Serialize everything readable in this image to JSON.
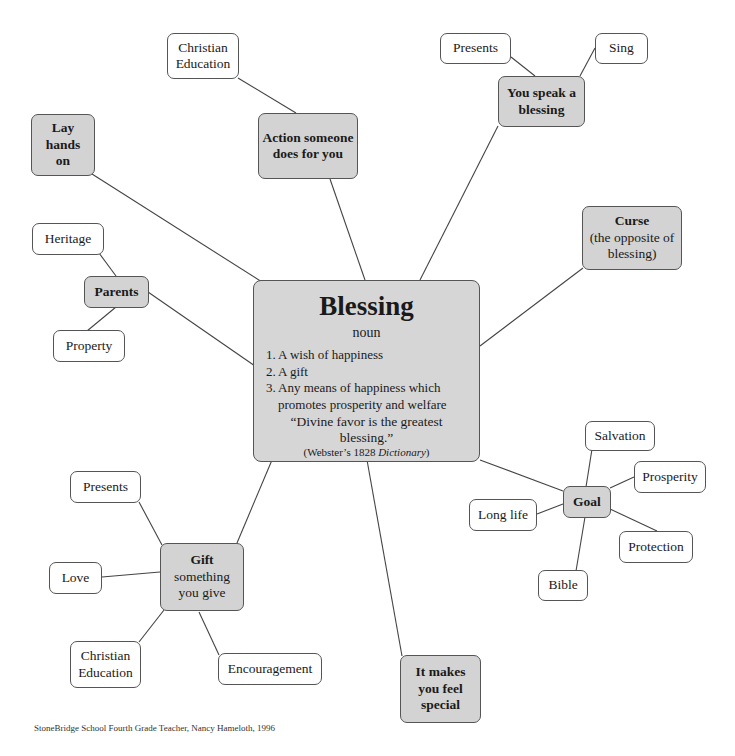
{
  "center": {
    "title": "Blessing",
    "part_of_speech": "noun",
    "definitions": [
      {
        "num": "1.",
        "text": "A wish of happiness"
      },
      {
        "num": "2.",
        "text": "A gift"
      },
      {
        "num": "3.",
        "text": "Any means of happiness which promotes prosperity and welfare"
      }
    ],
    "quote": "“Divine favor is the greatest blessing.”",
    "citation_prefix": "(Webster’s 1828 ",
    "citation_title": "Dictionary",
    "citation_suffix": ")"
  },
  "branches": {
    "lay_hands": {
      "label": "Lay hands on"
    },
    "action": {
      "label": "Action someone does for you",
      "children": [
        "Christian Education"
      ]
    },
    "speak": {
      "label": "You speak a blessing",
      "children": [
        "Presents",
        "Sing"
      ]
    },
    "curse": {
      "label": "Curse",
      "sub": "(the opposite of blessing)"
    },
    "parents": {
      "label": "Parents",
      "children": [
        "Heritage",
        "Property"
      ]
    },
    "goal": {
      "label": "Goal",
      "children": [
        "Salvation",
        "Prosperity",
        "Long life",
        "Protection",
        "Bible"
      ]
    },
    "gift": {
      "label": "Gift",
      "sub": "something you give",
      "children": [
        "Presents",
        "Love",
        "Christian Education",
        "Encouragement"
      ]
    },
    "special": {
      "label": "It makes you feel special"
    }
  },
  "footer": "StoneBridge School Fourth Grade Teacher, Nancy Hameloth, 1996",
  "colors": {
    "primary_fill": "#d3d3d3",
    "leaf_fill": "#ffffff",
    "border": "#555555",
    "line": "#444444"
  }
}
